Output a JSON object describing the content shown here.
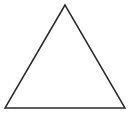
{
  "diagram": {
    "shape": "triangle",
    "type": "equilateral-outline",
    "stroke_color": "#2a2a2a",
    "fill_color": "none",
    "background_color": "#ffffff",
    "stroke_width": 1.5,
    "vertices": {
      "apex": [
        65,
        5
      ],
      "bottom_left": [
        5,
        108
      ],
      "bottom_right": [
        125,
        108
      ]
    }
  }
}
